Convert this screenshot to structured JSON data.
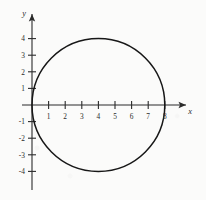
{
  "figure": {
    "background_color": "#fbfbfa",
    "ink_color": "#2b2b2b",
    "curve_color": "#171717"
  },
  "axes": {
    "x_label": "x",
    "y_label": "y",
    "x_ticks": [
      {
        "value": 1,
        "label": "1"
      },
      {
        "value": 2,
        "label": "2"
      },
      {
        "value": 3,
        "label": "3"
      },
      {
        "value": 4,
        "label": "4"
      },
      {
        "value": 5,
        "label": "5"
      },
      {
        "value": 6,
        "label": "6"
      },
      {
        "value": 7,
        "label": "7"
      },
      {
        "value": 8,
        "label": "8"
      }
    ],
    "y_ticks": [
      {
        "value": 4,
        "label": "4"
      },
      {
        "value": 3,
        "label": "3"
      },
      {
        "value": 2,
        "label": "2"
      },
      {
        "value": 1,
        "label": "1"
      },
      {
        "value": -1,
        "label": "-1"
      },
      {
        "value": -2,
        "label": "-2"
      },
      {
        "value": -3,
        "label": "-3"
      },
      {
        "value": -4,
        "label": "-4"
      }
    ]
  },
  "chart_data": {
    "type": "line",
    "title": "",
    "subtitle": "",
    "xlabel": "x",
    "ylabel": "y",
    "xlim": [
      -0.6,
      9.2
    ],
    "ylim": [
      -4.7,
      4.7
    ],
    "grid": false,
    "legend": false,
    "legend_position": "none",
    "shape": "circle",
    "equation": "(x - 4)^2 + y^2 = 16",
    "center": [
      4,
      0
    ],
    "radius": 4,
    "xticks": [
      1,
      2,
      3,
      4,
      5,
      6,
      7,
      8
    ],
    "yticks": [
      4,
      3,
      2,
      1,
      -1,
      -2,
      -3,
      -4
    ],
    "xticklabels": [
      "1",
      "2",
      "3",
      "4",
      "5",
      "6",
      "7",
      "8"
    ],
    "yticklabels": [
      "4",
      "3",
      "2",
      "1",
      "-1",
      "-2",
      "-3",
      "-4"
    ],
    "annotations": [],
    "series": [
      {
        "name": "circle",
        "x": [
          0.0,
          0.08,
          0.31,
          0.69,
          1.22,
          1.88,
          2.65,
          3.51,
          4.41,
          5.31,
          6.17,
          6.93,
          7.57,
          8.0,
          7.92,
          7.69,
          7.31,
          6.78,
          6.12,
          5.35,
          4.49,
          3.59,
          2.69,
          1.83,
          1.07,
          0.43,
          0.0
        ],
        "y": [
          0.0,
          1.22,
          2.35,
          3.31,
          3.94,
          4.0,
          3.91,
          3.51,
          2.84,
          1.96,
          0.92,
          -0.18,
          -1.27,
          -2.21,
          -3.05,
          -3.62,
          -3.95,
          -4.0,
          -3.78,
          -3.32,
          -2.65,
          -1.82,
          -0.9,
          0.09,
          1.14,
          2.17,
          0.0
        ]
      }
    ]
  }
}
